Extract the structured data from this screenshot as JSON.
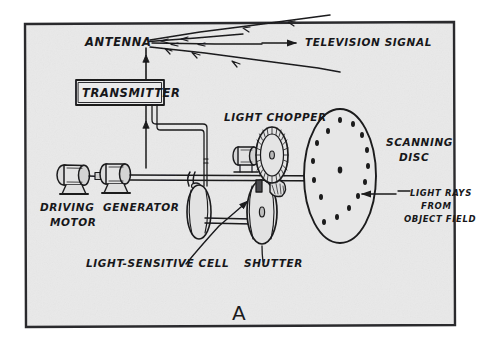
{
  "figure": {
    "caption_letter": "A",
    "frame": {
      "x": 24,
      "y": 22,
      "width": 431,
      "height": 305
    },
    "colors": {
      "paper": "#ffffff",
      "panel_background": "#e9e9e9",
      "ink": "#1a1a1c",
      "frame_border": "#2a2a2d"
    }
  },
  "labels": {
    "antenna": "ANTENNA",
    "television_signal": "TELEVISION  SIGNAL",
    "transmitter": "TRANSMITTER",
    "light_chopper": "LIGHT  CHOPPER",
    "scanning_disc_line1": "SCANNING",
    "scanning_disc_line2": "DISC",
    "light_rays_line1": "LIGHT RAYS",
    "light_rays_line2": "FROM",
    "light_rays_line3": "OBJECT FIELD",
    "driving_motor_line1": "DRIVING",
    "driving_motor_line2": "MOTOR",
    "generator": "GENERATOR",
    "light_sensitive_cell": "LIGHT-SENSITIVE CELL",
    "shutter": "SHUTTER"
  },
  "components": {
    "antenna_mast": {
      "x": 146,
      "top": 48,
      "bottom": 80
    },
    "transmitter_box": {
      "x": 76,
      "y": 80,
      "width": 88,
      "height": 25
    },
    "driving_motor": {
      "cx": 72,
      "cy": 180
    },
    "generator": {
      "cx": 114,
      "cy": 178
    },
    "light_chopper_wheel": {
      "cx": 272,
      "cy": 155,
      "rx": 16,
      "ry": 28
    },
    "scanning_disc": {
      "cx": 340,
      "cy": 176,
      "rx": 36,
      "ry": 67
    },
    "light_sensitive_cell_disc": {
      "cx": 201,
      "cy": 211,
      "rx": 12,
      "ry": 28
    },
    "shutter_disc": {
      "cx": 263,
      "cy": 212,
      "rx": 15,
      "ry": 32
    },
    "main_shaft": {
      "y": 178,
      "x1": 130,
      "x2": 345
    }
  },
  "scanning_disc_holes": [
    [
      340,
      121
    ],
    [
      353,
      126
    ],
    [
      362,
      137
    ],
    [
      367,
      151
    ],
    [
      368,
      166
    ],
    [
      365,
      181
    ],
    [
      358,
      194
    ],
    [
      348,
      205
    ],
    [
      336,
      213
    ],
    [
      323,
      218
    ],
    [
      317,
      145
    ],
    [
      313,
      162
    ],
    [
      315,
      180
    ],
    [
      322,
      196
    ],
    [
      340,
      170
    ]
  ],
  "arrows": {
    "television_signal_arrow": {
      "x1": 262,
      "y1": 43,
      "x2": 298,
      "y2": 43,
      "direction": "right"
    },
    "light_rays_arrow": {
      "x1": 395,
      "y1": 194,
      "x2": 360,
      "y2": 194,
      "direction": "left"
    },
    "antenna_signal_rays": 4
  }
}
